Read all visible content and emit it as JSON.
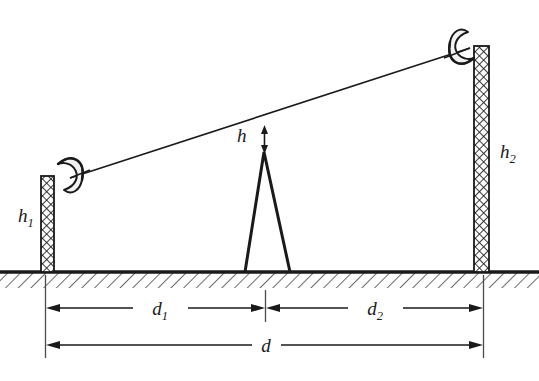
{
  "figure": {
    "name": "microwave-link-path-profile",
    "background_color": "#ffffff",
    "ink_color": "#1a1a1a"
  },
  "labels": {
    "h1": {
      "text": "h",
      "subscript": "1",
      "meaning": "height-of-left-tower"
    },
    "h2": {
      "text": "h",
      "subscript": "2",
      "meaning": "height-of-right-tower"
    },
    "h": {
      "text": "h",
      "subscript": "",
      "meaning": "clearance-between-obstacle-peak-and-line-of-sight"
    },
    "d1": {
      "text": "d",
      "subscript": "1",
      "meaning": "distance-left-tower-to-obstacle"
    },
    "d2": {
      "text": "d",
      "subscript": "2",
      "meaning": "distance-obstacle-to-right-tower"
    },
    "d": {
      "text": "d",
      "subscript": "",
      "meaning": "total-path-distance"
    }
  },
  "elements": {
    "ground_label": "ground-hatching",
    "left_tower_label": "left-tower-mast",
    "right_tower_label": "right-tower-mast",
    "left_antenna_label": "left-parabolic-dish",
    "right_antenna_label": "right-parabolic-dish",
    "obstacle_label": "terrain-obstacle-peak",
    "los_label": "line-of-sight-path",
    "clearance_arrow_label": "clearance-arrow"
  },
  "geometry": {
    "ground_y": 272,
    "left_tower": {
      "x": 41,
      "width": 13,
      "top_y": 176,
      "bottom_y": 272
    },
    "right_tower": {
      "x": 474,
      "width": 15,
      "top_y": 46,
      "bottom_y": 272
    },
    "line_of_sight": {
      "x1": 70,
      "y1": 178,
      "x2": 470,
      "y2": 48
    },
    "obstacle": {
      "peak_x": 266,
      "peak_y": 152,
      "base_left_x": 245,
      "base_right_x": 290
    },
    "clearance_arrow": {
      "x": 264,
      "top_y": 127,
      "bottom_y": 152
    },
    "dimension_row_1_y": 308,
    "dimension_row_2_y": 345,
    "extension_left_x": 45,
    "extension_mid_x": 265,
    "extension_right_x": 483
  }
}
